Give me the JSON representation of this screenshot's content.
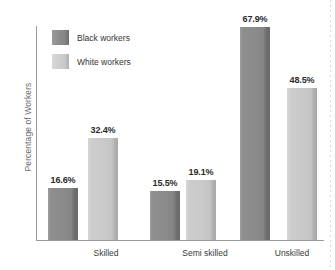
{
  "chart_data": {
    "type": "bar",
    "title": "",
    "subtitle": "",
    "xlabel": "",
    "ylabel": "Percentage of Workers",
    "categories": [
      "Skilled",
      "Semi skilled",
      "Unskilled"
    ],
    "series": [
      {
        "name": "Black workers",
        "color": "#8a8a8a",
        "values": [
          16.6,
          15.5,
          67.9
        ],
        "labels": [
          "16.6%",
          "15.5%",
          "67.9%"
        ]
      },
      {
        "name": "White workers",
        "color": "#c8c8c8",
        "values": [
          32.4,
          19.1,
          48.5
        ],
        "labels": [
          "32.4%",
          "19.1%",
          "48.5%"
        ]
      }
    ],
    "ylim": [
      0,
      67.9
    ],
    "grid": false,
    "y_ticks_visible": false,
    "legend_position": "top-left",
    "value_labels_position": "above-bar"
  },
  "legend": {
    "items": [
      {
        "label": "Black workers",
        "swatch": "dark-gray-swatch"
      },
      {
        "label": "White workers",
        "swatch": "light-gray-swatch"
      }
    ]
  },
  "axes": {
    "y_title": "Percentage of Workers",
    "x_tick_labels": [
      "Skilled",
      "Semi skilled",
      "Unskilled"
    ]
  },
  "colors": {
    "background": "#ffffff",
    "axis_line": "#9a9a9a",
    "bar_black_workers": "#8a8a8a",
    "bar_white_workers": "#c8c8c8",
    "value_label_text": "#2b2b2b",
    "axis_label_text": "#6d6d6d"
  }
}
